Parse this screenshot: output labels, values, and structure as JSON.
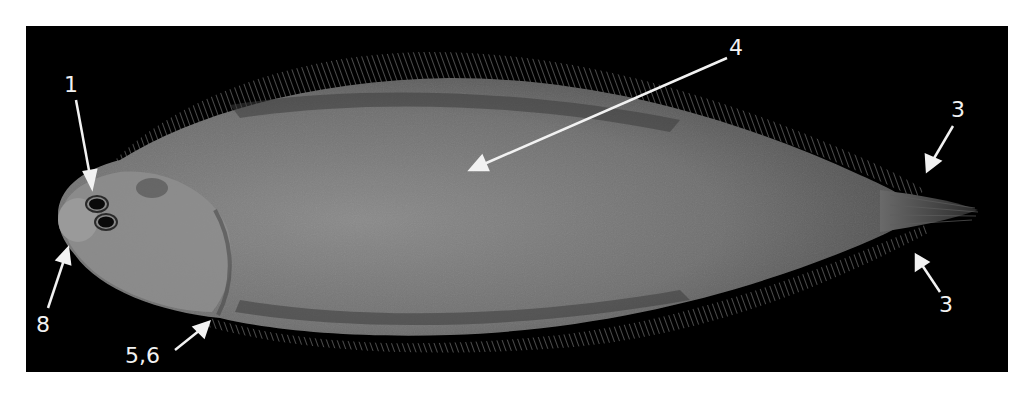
{
  "figure": {
    "background_color": "#000000",
    "page_color": "#ffffff",
    "annotation_color": "#f2f2f2",
    "fish_body_color": "#7a7a7a"
  },
  "annotations": [
    {
      "id": "label-1",
      "text": "1",
      "target": "eyes"
    },
    {
      "id": "label-4",
      "text": "4",
      "target": "mid-body"
    },
    {
      "id": "label-3-upper",
      "text": "3",
      "target": "caudal fin upper edge"
    },
    {
      "id": "label-3-lower",
      "text": "3",
      "target": "caudal fin lower edge"
    },
    {
      "id": "label-8",
      "text": "8",
      "target": "snout / mouth"
    },
    {
      "id": "label-5-6",
      "text": "5,6",
      "target": "pectoral region"
    }
  ]
}
